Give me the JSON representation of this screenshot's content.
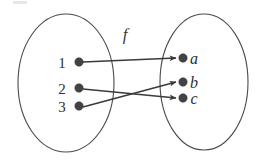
{
  "figure": {
    "kind": "function-mapping-diagram",
    "function_label": "f",
    "background_color": "#ffffff",
    "stroke_color": "#3a3a3a",
    "outline_color": "#4a4a4a",
    "dot_color": "#434343"
  },
  "domain_set": {
    "name": "domain",
    "elements": [
      {
        "label": "1",
        "cx": 79,
        "cy": 62,
        "label_x": 62,
        "label_y": 68
      },
      {
        "label": "2",
        "cx": 79,
        "cy": 88,
        "label_x": 62,
        "label_y": 94
      },
      {
        "label": "3",
        "cx": 79,
        "cy": 106,
        "label_x": 62,
        "label_y": 112
      }
    ],
    "ellipse": {
      "cx": 66,
      "cy": 83,
      "rx": 48,
      "ry": 69
    }
  },
  "codomain_set": {
    "name": "codomain",
    "elements": [
      {
        "label": "a",
        "cx": 183,
        "cy": 58,
        "label_x": 194,
        "label_y": 64
      },
      {
        "label": "b",
        "cx": 183,
        "cy": 82,
        "label_x": 194,
        "label_y": 88
      },
      {
        "label": "c",
        "cx": 183,
        "cy": 98,
        "label_x": 194,
        "label_y": 104
      }
    ],
    "ellipse": {
      "cx": 204,
      "cy": 82,
      "rx": 44,
      "ry": 68
    }
  },
  "mappings": [
    {
      "from": "1",
      "to": "a",
      "x1": 83,
      "y1": 62,
      "x2": 176,
      "y2": 58
    },
    {
      "from": "2",
      "to": "c",
      "x1": 83,
      "y1": 89,
      "x2": 176,
      "y2": 98
    },
    {
      "from": "3",
      "to": "b",
      "x1": 83,
      "y1": 107,
      "x2": 176,
      "y2": 82
    }
  ],
  "function_label_position": {
    "x": 125,
    "y": 40
  }
}
